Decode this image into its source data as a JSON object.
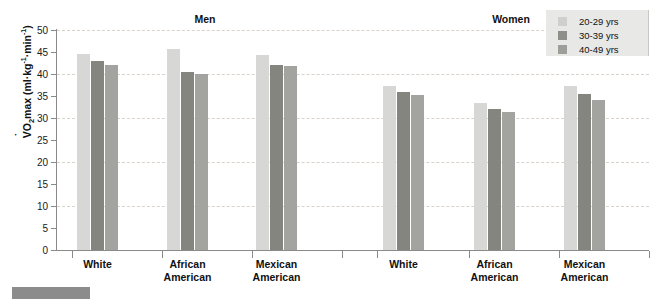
{
  "chart_data": {
    "type": "bar",
    "title": "",
    "xlabel": "",
    "ylabel": "VO2max (ml·kg-1·min-1)",
    "ylim": [
      0,
      50
    ],
    "yticks": [
      0,
      5,
      10,
      15,
      20,
      25,
      30,
      35,
      40,
      45,
      50
    ],
    "grid": "horizontal dashed at 10, 20, 30, 40, 50",
    "legend_position": "top-right",
    "legend": [
      "20-29 yrs",
      "30-39 yrs",
      "40-49 yrs"
    ],
    "panels": [
      {
        "name": "Men",
        "categories": [
          "White",
          "African American",
          "Mexican American"
        ],
        "series": [
          {
            "name": "20-29 yrs",
            "values": [
              44.5,
              45.7,
              44.3
            ]
          },
          {
            "name": "30-39 yrs",
            "values": [
              43.0,
              40.5,
              42.0
            ]
          },
          {
            "name": "40-49 yrs",
            "values": [
              42.0,
              40.0,
              41.8
            ]
          }
        ]
      },
      {
        "name": "Women",
        "categories": [
          "White",
          "African American",
          "Mexican American"
        ],
        "series": [
          {
            "name": "20-29 yrs",
            "values": [
              37.3,
              33.5,
              37.3
            ]
          },
          {
            "name": "30-39 yrs",
            "values": [
              36.0,
              32.0,
              35.5
            ]
          },
          {
            "name": "40-49 yrs",
            "values": [
              35.3,
              31.3,
              34.0
            ]
          }
        ]
      }
    ],
    "colors": {
      "series_20_29": "#d7d7d5",
      "series_30_39": "#84857f",
      "series_40_49": "#a3a49f",
      "axis": "#8a8a8a",
      "gridline": "#d9d2cc",
      "text": "#111111",
      "legend_background": "#e8e8e6"
    }
  },
  "axis": {
    "y_title_prefix": "V",
    "y_title_o": "O",
    "y_title_sub": "2",
    "y_title_mid": "max (ml·kg",
    "y_title_sup1": "-1",
    "y_title_mid2": "·min",
    "y_title_sup2": "-1",
    "y_title_end": ")",
    "ticks": [
      "50",
      "45",
      "40",
      "35",
      "30",
      "25",
      "20",
      "15",
      "10",
      "5",
      "0"
    ]
  },
  "panels": {
    "men_title": "Men",
    "women_title": "Women"
  },
  "groups": {
    "white": "White",
    "african_line1": "African",
    "african_line2": "American",
    "mexican_line1": "Mexican",
    "mexican_line2": "American"
  },
  "legend": {
    "items": [
      {
        "label": "20-29 yrs"
      },
      {
        "label": "30-39 yrs"
      },
      {
        "label": "40-49 yrs"
      }
    ]
  }
}
